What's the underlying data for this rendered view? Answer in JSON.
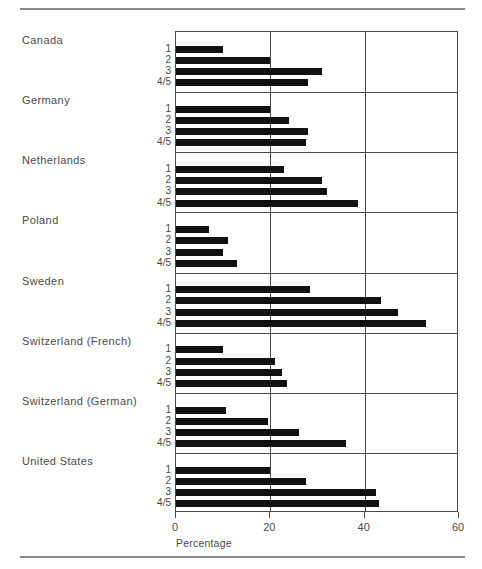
{
  "chart_data": {
    "type": "bar",
    "orientation": "horizontal",
    "title": "",
    "xlabel": "Percentage",
    "ylabel": "",
    "xlim": [
      0,
      60
    ],
    "xticks": [
      0,
      20,
      40,
      60
    ],
    "xtick_labels": [
      "0",
      "20",
      "40",
      "60"
    ],
    "grid": "vertical",
    "legend": "none",
    "subcategories": [
      "1",
      "2",
      "3",
      "4/5"
    ],
    "groups": [
      {
        "name": "Canada",
        "values": [
          10.0,
          20.0,
          31.0,
          28.0
        ]
      },
      {
        "name": "Germany",
        "values": [
          20.0,
          24.0,
          28.0,
          27.5
        ]
      },
      {
        "name": "Netherlands",
        "values": [
          23.0,
          31.0,
          32.0,
          38.5
        ]
      },
      {
        "name": "Poland",
        "values": [
          7.0,
          11.0,
          10.0,
          13.0
        ]
      },
      {
        "name": "Sweden",
        "values": [
          28.5,
          43.5,
          47.0,
          53.0
        ]
      },
      {
        "name": "Switzerland (French)",
        "values": [
          10.0,
          21.0,
          22.5,
          23.5
        ]
      },
      {
        "name": "Switzerland (German)",
        "values": [
          10.5,
          19.5,
          26.0,
          36.0
        ]
      },
      {
        "name": "United States",
        "values": [
          20.0,
          27.5,
          42.5,
          43.0
        ]
      }
    ]
  },
  "colors": {
    "bar": "#111111",
    "axis": "#4a4a4a",
    "rule": "#8a8a8a",
    "text": "#4a4a4a",
    "background": "#ffffff"
  }
}
